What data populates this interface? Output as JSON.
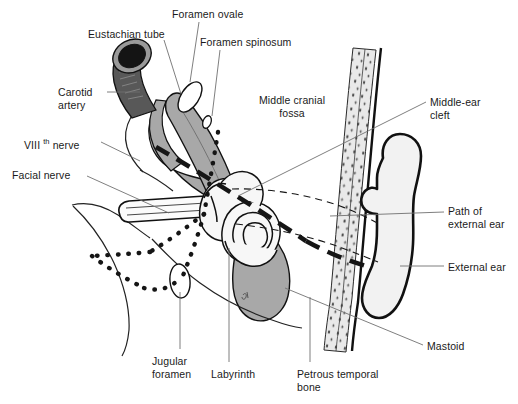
{
  "figure": {
    "type": "anatomical-diagram",
    "width": 518,
    "height": 404,
    "background": "#ffffff"
  },
  "colors": {
    "bone_gray": "#a8a8a8",
    "artery_dark": "#585858",
    "artery_lumen": "#1a1a1a",
    "skin_band": "#e9e9e9",
    "ear_fill": "#f2f2f2",
    "outline": "#1a1a1a",
    "leader": "#6b6b6b",
    "text": "#1a1a1a"
  },
  "labels": [
    {
      "id": "eustachian-tube",
      "text": "Eustachian tube",
      "x": 88,
      "y": 28,
      "align": "left"
    },
    {
      "id": "foramen-ovale",
      "text": "Foramen ovale",
      "x": 172,
      "y": 8,
      "align": "left"
    },
    {
      "id": "foramen-spinosum",
      "text": "Foramen spinosum",
      "x": 200,
      "y": 36,
      "align": "left"
    },
    {
      "id": "carotid-artery",
      "text": "Carotid\nartery",
      "x": 58,
      "y": 86,
      "align": "left"
    },
    {
      "id": "viii-nerve",
      "text": "VIII th nerve",
      "x": 24,
      "y": 136,
      "align": "left"
    },
    {
      "id": "facial-nerve",
      "text": "Facial nerve",
      "x": 12,
      "y": 169,
      "align": "left"
    },
    {
      "id": "middle-cranial-fossa",
      "text": "Middle cranial\nfossa",
      "x": 249,
      "y": 94,
      "align": "center"
    },
    {
      "id": "middle-ear-cleft",
      "text": "Middle-ear\ncleft",
      "x": 430,
      "y": 96,
      "align": "left"
    },
    {
      "id": "path-of-external-ear",
      "text": "Path of\nexternal ear",
      "x": 448,
      "y": 205,
      "align": "left"
    },
    {
      "id": "external-ear",
      "text": "External ear",
      "x": 448,
      "y": 261,
      "align": "left"
    },
    {
      "id": "mastoid",
      "text": "Mastoid",
      "x": 427,
      "y": 340,
      "align": "left"
    },
    {
      "id": "jugular-foramen",
      "text": "Jugular\nforamen",
      "x": 152,
      "y": 355,
      "align": "left"
    },
    {
      "id": "labyrinth",
      "text": "Labyrinth",
      "x": 211,
      "y": 368,
      "align": "left"
    },
    {
      "id": "petrous-temporal-bone",
      "text": "Petrous temporal\nbone",
      "x": 297,
      "y": 368,
      "align": "left"
    }
  ],
  "structures": [
    {
      "id": "carotid-artery",
      "name": "Carotid artery",
      "fill": "#585858",
      "note": "dark tube with black lumen at upper end"
    },
    {
      "id": "eustachian-tube",
      "name": "Eustachian tube",
      "fill": "#a8a8a8",
      "note": "light grey tube running infero-laterally"
    },
    {
      "id": "petrous-temporal-bone",
      "name": "Petrous temporal bone",
      "fill": "#a8a8a8",
      "note": "large grey wedge of bone"
    },
    {
      "id": "labyrinth",
      "name": "Labyrinth",
      "fill": "#f5f5f5",
      "note": "cochlea and semicircular canals outline"
    },
    {
      "id": "external-ear",
      "name": "External ear",
      "fill": "#f2f2f2",
      "note": "pinna silhouette at right"
    },
    {
      "id": "skin-band",
      "name": "Skull / skin band",
      "fill": "#e9e9e9",
      "note": "stippled vertical band"
    },
    {
      "id": "foramen-ovale",
      "name": "Foramen ovale",
      "fill": "#ffffff",
      "note": "small oval opening"
    },
    {
      "id": "foramen-spinosum",
      "name": "Foramen spinosum",
      "fill": "#ffffff",
      "note": "tiny opening below ovale"
    },
    {
      "id": "jugular-foramen",
      "name": "Jugular foramen",
      "fill": "#ffffff",
      "note": "oval opening low centre"
    }
  ],
  "line_styles": [
    {
      "id": "facial-nerve-path",
      "style": "thick-dashed",
      "note": "heavy black dashes crossing the bone"
    },
    {
      "id": "viii-nerve-path",
      "style": "dotted",
      "note": "round black dots"
    },
    {
      "id": "external-ear-path",
      "style": "thin-dashed",
      "note": "fine dashed curves toward ear canal"
    },
    {
      "id": "leader-line",
      "style": "solid-thin",
      "note": "grey label pointers"
    }
  ]
}
